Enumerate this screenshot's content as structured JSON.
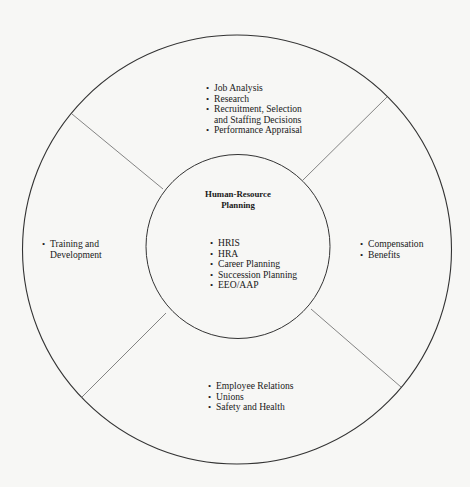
{
  "diagram": {
    "type": "concentric-circle-segments",
    "center": {
      "title_line1": "Human-Resource",
      "title_line2": "Planning",
      "items": [
        "HRIS",
        "HRA",
        "Career Planning",
        "Succession Planning",
        "EEO/AAP"
      ]
    },
    "segments": {
      "top": {
        "items": [
          "Job Analysis",
          "Research",
          "Recruitment, Selection",
          "Performance Appraisal"
        ],
        "continuation": "and Staffing Decisions"
      },
      "left": {
        "line1": "Training and",
        "line2": "Development"
      },
      "right": {
        "items": [
          "Compensation",
          "Benefits"
        ]
      },
      "bottom": {
        "items": [
          "Employee Relations",
          "Unions",
          "Safety and Health"
        ]
      }
    },
    "colors": {
      "background": "#f7f7f5",
      "stroke": "#333333",
      "divider": "#666666",
      "text": "#1a1a1a"
    }
  }
}
